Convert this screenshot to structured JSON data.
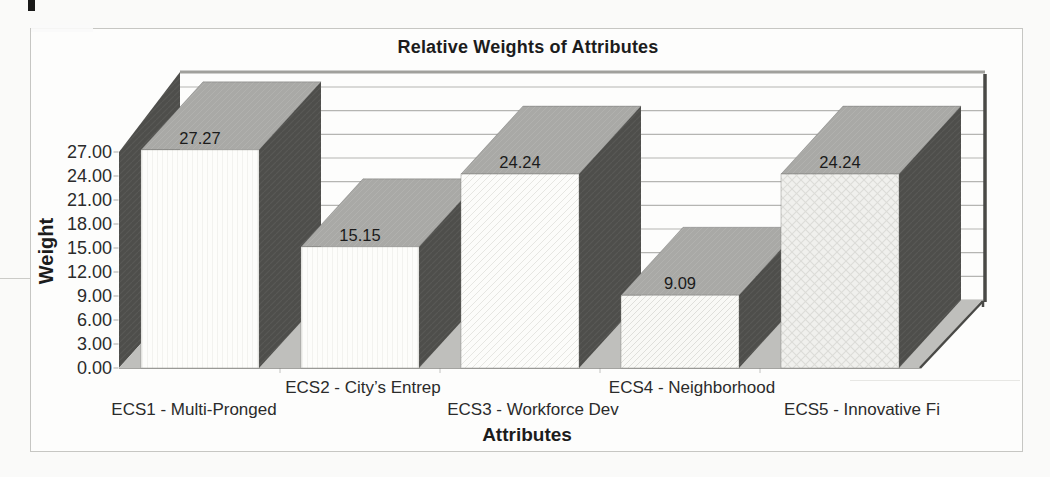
{
  "page": {
    "background": "#fafaf9",
    "frame_fill": "#fdfdfc",
    "frame_border": "#c6c6c3"
  },
  "chart_data": {
    "type": "bar",
    "variant": "3d-column",
    "title": "Relative Weights of Attributes",
    "xlabel": "Attributes",
    "ylabel": "Weight",
    "categories": [
      "ECS1 - Multi-Pronged",
      "ECS2 - City’s Entrep",
      "ECS3 - Workforce Dev",
      "ECS4 - Neighborhood",
      "ECS5 - Innovative Fi"
    ],
    "values": [
      27.27,
      15.15,
      24.24,
      9.09,
      24.24
    ],
    "value_labels": [
      "27.27",
      "15.15",
      "24.24",
      "9.09",
      "24.24"
    ],
    "ylim": [
      0,
      27
    ],
    "ytick_step": 3,
    "ytick_labels": [
      "0.00",
      "3.00",
      "6.00",
      "9.00",
      "12.00",
      "15.00",
      "18.00",
      "21.00",
      "24.00",
      "27.00"
    ],
    "grid": true,
    "legend_position": "none",
    "front_styles": [
      "plain",
      "plain",
      "hatch-light",
      "hatch",
      "weave"
    ],
    "colors": {
      "text": "#2b2b2b",
      "title_text": "#1c1c1c",
      "data_label_text": "#1b1b1b",
      "gridline": "#b5b5b2",
      "wall_top_edge": "#90908c",
      "side_dark": "#4e4e4b",
      "top_gray": "#a9a9a6",
      "floor": "#bfbfbc",
      "right_wall_edge": "#494946",
      "baseline": "#a3a3a0"
    }
  }
}
